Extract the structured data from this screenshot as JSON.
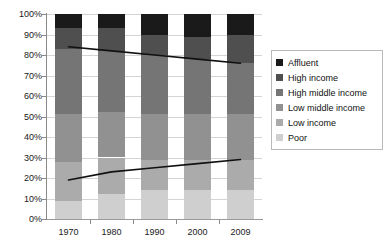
{
  "chart_data": {
    "type": "bar",
    "subtype": "100% stacked bar with overlaid trend lines",
    "title": "",
    "subtitle": "",
    "xlabel": "",
    "ylabel": "",
    "categories": [
      "1970",
      "1980",
      "1990",
      "2000",
      "2009"
    ],
    "ylim": [
      0,
      100
    ],
    "ytick_values": [
      0,
      10,
      20,
      30,
      40,
      50,
      60,
      70,
      80,
      90,
      100
    ],
    "ytick_labels": [
      "0%",
      "10%",
      "20%",
      "30%",
      "40%",
      "50%",
      "60%",
      "70%",
      "80%",
      "90%",
      "100%"
    ],
    "grid": true,
    "grid_axis": "y",
    "legend_position": "right",
    "stack_order_top_to_bottom": [
      "Affluent",
      "High income",
      "High middle income",
      "Low middle income",
      "Low income",
      "Poor"
    ],
    "series": [
      {
        "name": "Affluent",
        "color": "#1a1a1a",
        "values": [
          7,
          7,
          10,
          11,
          10
        ]
      },
      {
        "name": "High income",
        "color": "#4f4f4f",
        "values": [
          10,
          11,
          10,
          11,
          14
        ]
      },
      {
        "name": "High middle income",
        "color": "#757575",
        "values": [
          32,
          30,
          29,
          27,
          25
        ]
      },
      {
        "name": "Low middle income",
        "color": "#919191",
        "values": [
          23,
          22,
          22,
          22,
          22
        ]
      },
      {
        "name": "Low income",
        "color": "#ababab",
        "values": [
          19,
          18,
          15,
          15,
          15
        ]
      },
      {
        "name": "Poor",
        "color": "#cfcfcf",
        "values": [
          9,
          12,
          14,
          14,
          14
        ]
      }
    ],
    "cumulative_tops_percent": {
      "Affluent": [
        100,
        100,
        100,
        100,
        100
      ],
      "High income": [
        93,
        93,
        90,
        89,
        90
      ],
      "High middle income": [
        83,
        82,
        80,
        78,
        76
      ],
      "Low middle income": [
        51,
        52,
        51,
        51,
        51
      ],
      "Low income": [
        28,
        30,
        29,
        29,
        29
      ],
      "Poor": [
        9,
        12,
        14,
        14,
        14
      ]
    },
    "trend_lines": [
      {
        "name": "upper-trend-line",
        "color": "#111111",
        "x": [
          "1970",
          "1980",
          "1990",
          "2000",
          "2009"
        ],
        "values": [
          84,
          82,
          80,
          78,
          76
        ]
      },
      {
        "name": "lower-trend-line",
        "color": "#111111",
        "x": [
          "1970",
          "1980",
          "1990",
          "2000",
          "2009"
        ],
        "values": [
          19,
          23,
          25,
          27,
          29
        ]
      }
    ]
  },
  "axes": {
    "y_labels": [
      "100%",
      "90%",
      "80%",
      "70%",
      "60%",
      "50%",
      "40%",
      "30%",
      "20%",
      "10%",
      "0%"
    ],
    "x_labels": [
      "1970",
      "1980",
      "1990",
      "2000",
      "2009"
    ]
  },
  "legend": {
    "items": [
      {
        "label": "Affluent",
        "color": "#1a1a1a"
      },
      {
        "label": "High income",
        "color": "#4f4f4f"
      },
      {
        "label": "High middle income",
        "color": "#757575"
      },
      {
        "label": "Low middle income",
        "color": "#919191"
      },
      {
        "label": "Low income",
        "color": "#ababab"
      },
      {
        "label": "Poor",
        "color": "#cfcfcf"
      }
    ]
  }
}
